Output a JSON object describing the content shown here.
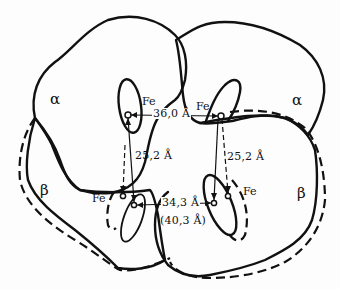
{
  "diagram": {
    "subunits": [
      {
        "id": "alpha-left",
        "label": "α"
      },
      {
        "id": "alpha-right",
        "label": "α"
      },
      {
        "id": "beta-left",
        "label": "β"
      },
      {
        "id": "beta-right",
        "label": "β"
      }
    ],
    "fe_labels": {
      "alpha_left": "Fe",
      "alpha_right": "Fe",
      "beta_left": "Fe",
      "beta_right": "Fe"
    },
    "distances": {
      "alpha_alpha": "36,0 Å",
      "alpha_beta_left": "25,2 Å",
      "alpha_beta_right": "25,2 Å",
      "beta_beta": "34,3 Å",
      "beta_beta_alt": "(40,3 Å)"
    },
    "legend_style": {
      "solid": "one conformation",
      "dashed": "alternate conformation"
    },
    "colors": {
      "ink": "#111111",
      "background": "#fdfdfd"
    }
  }
}
